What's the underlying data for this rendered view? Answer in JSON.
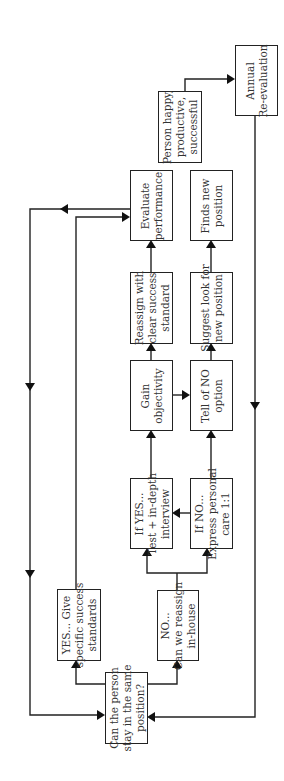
{
  "diagram": {
    "type": "flowchart",
    "orientation": "rotated-90-ccw",
    "colors": {
      "line": "#222222",
      "text": "#333333",
      "background": "#ffffff"
    },
    "nodes": {
      "start": {
        "lines": [
          "Can the person",
          "stay in the same",
          "position?"
        ]
      },
      "yes_give": {
        "lines": [
          "YES... Give",
          "specific success",
          "standards"
        ]
      },
      "no_reassign": {
        "lines": [
          "NO...",
          "Can we reassign",
          "in-house"
        ]
      },
      "if_yes": {
        "lines": [
          "If YES...",
          "Test + in-depth",
          "interview"
        ]
      },
      "if_no": {
        "lines": [
          "If NO...",
          "Express personal",
          "care 1:1"
        ]
      },
      "gain": {
        "lines": [
          "Gain",
          "objectivity"
        ]
      },
      "tell_no": {
        "lines": [
          "Tell of NO",
          "option"
        ]
      },
      "reassign": {
        "lines": [
          "Reassign with",
          "clear success",
          "standard"
        ]
      },
      "suggest": {
        "lines": [
          "Suggest look for",
          "new position"
        ]
      },
      "evaluate": {
        "lines": [
          "Evaluate",
          "performance"
        ]
      },
      "finds": {
        "lines": [
          "Finds new",
          "position"
        ]
      },
      "happy": {
        "lines": [
          "Person happy,",
          "productive,",
          "successful"
        ]
      },
      "annual": {
        "lines": [
          "Annual",
          "Re-evaluation"
        ]
      }
    },
    "edges": [
      [
        "start",
        "yes_give"
      ],
      [
        "start",
        "no_reassign"
      ],
      [
        "no_reassign",
        "if_yes"
      ],
      [
        "no_reassign",
        "if_no"
      ],
      [
        "if_no",
        "if_yes"
      ],
      [
        "if_yes",
        "gain"
      ],
      [
        "if_no",
        "tell_no"
      ],
      [
        "gain",
        "tell_no"
      ],
      [
        "gain",
        "reassign"
      ],
      [
        "tell_no",
        "suggest"
      ],
      [
        "reassign",
        "evaluate"
      ],
      [
        "suggest",
        "finds"
      ],
      [
        "yes_give",
        "evaluate"
      ],
      [
        "evaluate",
        "start"
      ],
      [
        "happy",
        "annual"
      ],
      [
        "annual",
        "start"
      ]
    ]
  }
}
